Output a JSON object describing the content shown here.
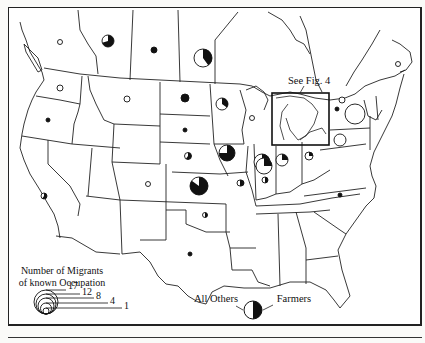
{
  "map": {
    "title": "Number of Migrants of known Occupation",
    "callout_label": "See Fig. 4",
    "legend": {
      "size_title_line1": "Number of Migrants",
      "size_title_line2": "of known Occupation",
      "sizes": [
        {
          "label": "17",
          "r": 12
        },
        {
          "label": "12",
          "r": 10
        },
        {
          "label": "8",
          "r": 8
        },
        {
          "label": "4",
          "r": 5.5
        },
        {
          "label": "1",
          "r": 3
        }
      ],
      "pie_left_label": "All Others",
      "pie_right_label": "Farmers"
    },
    "colors": {
      "farmers": "#111111",
      "others": "#ffffff",
      "lines": "#222222"
    },
    "symbols": [
      {
        "name": "british-columbia",
        "x": 60,
        "y": 42,
        "r": 2.5,
        "farmers": 0
      },
      {
        "name": "alberta",
        "x": 108,
        "y": 41,
        "r": 6,
        "farmers": 0.7
      },
      {
        "name": "saskatchewan",
        "x": 154,
        "y": 50,
        "r": 3,
        "farmers": 1
      },
      {
        "name": "manitoba",
        "x": 203,
        "y": 58,
        "r": 9,
        "farmers": 0.4
      },
      {
        "name": "washington",
        "x": 60,
        "y": 88,
        "r": 3,
        "farmers": 0
      },
      {
        "name": "oregon",
        "x": 48,
        "y": 120,
        "r": 2,
        "farmers": 1
      },
      {
        "name": "montana",
        "x": 127,
        "y": 99,
        "r": 3,
        "farmers": 0
      },
      {
        "name": "north-dakota",
        "x": 185,
        "y": 98,
        "r": 4,
        "farmers": 1
      },
      {
        "name": "south-dakota",
        "x": 185,
        "y": 130,
        "r": 2,
        "farmers": 1
      },
      {
        "name": "nebraska",
        "x": 188,
        "y": 156,
        "r": 3.5,
        "farmers": 0.6
      },
      {
        "name": "kansas",
        "x": 199,
        "y": 186,
        "r": 9,
        "farmers": 0.85
      },
      {
        "name": "colorado",
        "x": 148,
        "y": 184,
        "r": 2.5,
        "farmers": 0
      },
      {
        "name": "oklahoma",
        "x": 205,
        "y": 215,
        "r": 2.5,
        "farmers": 0.5
      },
      {
        "name": "texas",
        "x": 190,
        "y": 254,
        "r": 2,
        "farmers": 1
      },
      {
        "name": "california",
        "x": 44,
        "y": 196,
        "r": 3,
        "farmers": 0.6
      },
      {
        "name": "minnesota",
        "x": 222,
        "y": 104,
        "r": 6,
        "farmers": 0.35
      },
      {
        "name": "iowa",
        "x": 227,
        "y": 153,
        "r": 8,
        "farmers": 0.75
      },
      {
        "name": "missouri",
        "x": 241,
        "y": 183,
        "r": 3,
        "farmers": 0.5
      },
      {
        "name": "wisconsin",
        "x": 252,
        "y": 118,
        "r": 2.5,
        "farmers": 0
      },
      {
        "name": "illinois-north",
        "x": 262,
        "y": 162,
        "r": 8,
        "farmers": 0.25
      },
      {
        "name": "illinois",
        "x": 264,
        "y": 166,
        "r": 8,
        "farmers": 0.25
      },
      {
        "name": "indiana",
        "x": 282,
        "y": 160,
        "r": 6,
        "farmers": 0.25
      },
      {
        "name": "ohio",
        "x": 309,
        "y": 156,
        "r": 4,
        "farmers": 0.25
      },
      {
        "name": "west-penn",
        "x": 340,
        "y": 140,
        "r": 6,
        "farmers": 0
      },
      {
        "name": "new-york",
        "x": 355,
        "y": 114,
        "r": 10,
        "farmers": 0
      },
      {
        "name": "ontario-east",
        "x": 342,
        "y": 100,
        "r": 3,
        "farmers": 0
      },
      {
        "name": "quebec-dot",
        "x": 337,
        "y": 109,
        "r": 2,
        "farmers": 1
      },
      {
        "name": "new-brunswick",
        "x": 398,
        "y": 64,
        "r": 2.5,
        "farmers": 0
      },
      {
        "name": "kentucky",
        "x": 240,
        "y": 183,
        "r": 3,
        "farmers": 0.5
      },
      {
        "name": "north-carolina",
        "x": 340,
        "y": 195,
        "r": 2,
        "farmers": 1
      },
      {
        "name": "indiana-small",
        "x": 265,
        "y": 180,
        "r": 3,
        "farmers": 0.5
      }
    ]
  }
}
